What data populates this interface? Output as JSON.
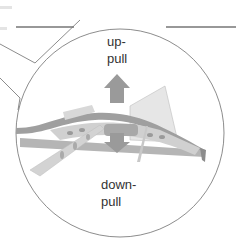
{
  "diagram": {
    "labels": {
      "up_line1": "up-",
      "up_line2": "pull",
      "down_line1": "down-",
      "down_line2": "pull"
    },
    "colors": {
      "outline": "#6e6e6e",
      "leader_line": "#333333",
      "arrow": "#9a9a9a",
      "structure": "#c8c8c8",
      "structure_dark": "#8c8c8c",
      "text": "#333333",
      "background": "#ffffff"
    },
    "icons": {
      "up_arrow": "arrow-up-icon",
      "down_arrow": "arrow-down-icon"
    }
  }
}
